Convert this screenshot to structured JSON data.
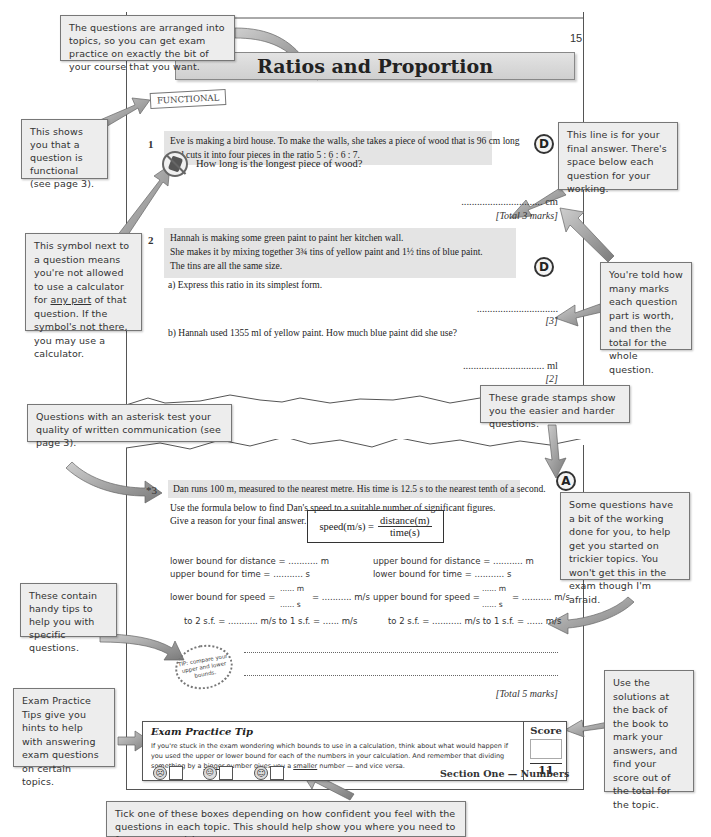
{
  "page": {
    "number": "15",
    "title": "Ratios and Proportion",
    "functional_tag": "FUNCTIONAL",
    "footer": "Section One — Numbers"
  },
  "questions": [
    {
      "number": "1",
      "text_line1": "Eve is making a bird house.  To make the walls, she takes a piece of wood that is 96 cm long",
      "text_line2": "and cuts it into four pieces in the ratio 5 : 6 : 6 : 7.",
      "grade": "D",
      "prompt": "How long is the longest piece of wood?",
      "answer_line": "............................... cm",
      "marks": "[Total 3 marks]"
    },
    {
      "number": "2",
      "text_line1": "Hannah is making some green paint to paint her kitchen wall.",
      "text_line2": "She makes it by mixing together 3¾ tins of yellow paint and 1½ tins of blue paint.",
      "text_line3": "The tins are all the same size.",
      "grade": "D",
      "part_a": "a)  Express this ratio in its simplest form.",
      "part_a_answer": "...............................",
      "part_a_marks": "[3]",
      "part_b": "b)  Hannah used 1355 ml of yellow paint.  How much blue paint did she use?",
      "part_b_answer": "............................... ml",
      "part_b_marks": "[2]"
    },
    {
      "number": "*3",
      "text_line1": "Dan runs 100 m, measured to the nearest metre.  His time is 12.5 s to the nearest tenth of a second.",
      "text_line2": "Use the formula below to find Dan's speed to a suitable number of significant figures.",
      "text_line3": "Give a reason for your final answer.",
      "grade": "A",
      "formula": {
        "lhs": "speed(m/s) =",
        "numerator": "distance(m)",
        "denominator": "time(s)"
      },
      "working": {
        "lower_distance": "lower bound for distance = ........... m",
        "upper_time": "upper bound for time = ........... s",
        "upper_distance": "upper bound for distance = ........... m",
        "lower_time": "lower bound for time = ........... s",
        "lower_speed": "lower bound for speed =",
        "upper_speed": "upper bound for speed =",
        "speed_num": "...... m",
        "speed_den": "...... s",
        "speed_result": "= ........... m/s",
        "left_sf": "to 2 s.f. = ........... m/s     to 1 s.f. = ...... m/s",
        "right_sf": "to 2 s.f. = ........... m/s     to 1 s.f. = ...... m/s"
      },
      "tip_burst": "TIP: compare your upper and lower bounds.",
      "marks": "[Total 5 marks]"
    }
  ],
  "exam_tip": {
    "title": "Exam Practice Tip",
    "body_pre": "If you're stuck in the exam wondering which bounds to use in a calculation, think about what would happen if you used the upper or lower bound for each of the numbers in your calculation.  And remember that dividing something by a ",
    "body_bigger": "bigger",
    "body_mid": " number gives you a ",
    "body_smaller": "smaller",
    "body_post": " number — and vice versa.",
    "score_label": "Score",
    "score_value": "",
    "score_total": "11"
  },
  "confidence": [
    {
      "face": "sad",
      "glyph": "☹"
    },
    {
      "face": "neutral",
      "glyph": "😐"
    },
    {
      "face": "happy",
      "glyph": "☺"
    }
  ],
  "callouts": {
    "topics": "The questions are arranged into topics, so you can get exam practice on exactly the bit of your course that you want.",
    "functional": "This shows you that a question is functional (see page 3).",
    "calculator_pre": "This symbol next to a question means you're not allowed to use a calculator for ",
    "calculator_underline": "any part",
    "calculator_post": " of that question.  If the symbol's not there, you may use a calculator.",
    "answer_line": "This line is for your final answer.  There's space below each question for your working.",
    "marks": "You're told how many marks each question part is worth, and then the total for the whole question.",
    "grade_stamps": "These grade stamps show you the easier and harder questions.",
    "asterisk": "Questions with an asterisk test your quality of written communication (see page 3).",
    "working": "Some questions have a bit of the working done for you, to help get you started on trickier topics.  You won't get this in the exam though I'm afraid.",
    "tips": "These contain handy tips to help you with specific questions.",
    "solutions": "Use the solutions at the back of the book to mark your answers, and find your score out of the total for the topic.",
    "exam_tips": "Exam Practice Tips give you hints to help with answering exam questions on certain topics.",
    "tick_boxes": "Tick one of these boxes depending on how confident you feel with the questions in each topic.  This should help show you where you need to focus your revision."
  },
  "colors": {
    "callout_bg": "#ededed",
    "question_highlight": "#e4e4e4",
    "arrow": "#8a8a8a"
  }
}
